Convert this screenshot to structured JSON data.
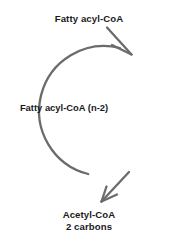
{
  "diagram": {
    "stroke_color": "#6b6b6b",
    "text_color": "#1a1a1a",
    "background_color": "#ffffff",
    "cycle": {
      "shape": "circle",
      "direction": "clockwise",
      "center_x": 93,
      "center_y": 111,
      "radius": 63,
      "stroke_width": 2.2
    },
    "input_arrow": {
      "name": "fatty-acyl-coa-input-arrow",
      "from_label": "Fatty acyl-CoA",
      "points_into_cycle": true
    },
    "output_arrow": {
      "name": "acetyl-coa-output-arrow",
      "to_label": "Acetyl-CoA",
      "points_out_of_cycle": true
    },
    "labels": {
      "input": "Fatty acyl-CoA",
      "recycled": "Fatty acyl-CoA (n-2)",
      "output_line1": "Acetyl-CoA",
      "output_line2": "2 carbons"
    }
  }
}
